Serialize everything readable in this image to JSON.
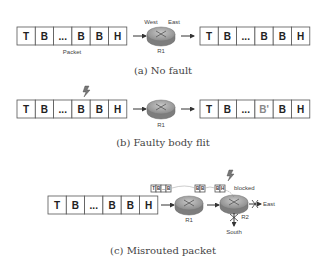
{
  "flit_labels": [
    "T",
    "B",
    "...",
    "B",
    "B",
    "H"
  ],
  "faulty_flit_labels": [
    "T",
    "B",
    "...",
    "B'",
    "B",
    "H"
  ],
  "panel_a": {
    "caption": "(a) No fault",
    "packet_label": "Packet",
    "router_label": "R1",
    "west_label": "West",
    "east_label": "East"
  },
  "panel_b": {
    "caption": "(b) Faulty body flit",
    "router_label": "R1"
  },
  "panel_c": {
    "caption": "(c) Misrouted packet",
    "router1_label": "R1",
    "router2_label": "R2",
    "blocked_label": "blocked",
    "east_label": "East",
    "south_label": "South",
    "buffer1_labels": [
      "T",
      "B",
      "..",
      "B"
    ],
    "buffer2_labels": [
      "B",
      "B"
    ],
    "buffer3_labels": [
      "B",
      "H"
    ]
  }
}
